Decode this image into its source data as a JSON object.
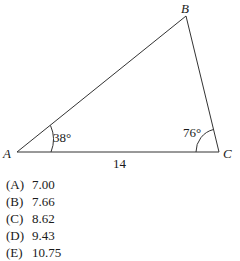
{
  "figure": {
    "vertices": {
      "A": {
        "label": "A",
        "x": 17,
        "y": 152
      },
      "B": {
        "label": "B",
        "x": 186,
        "y": 16
      },
      "C": {
        "label": "C",
        "x": 219,
        "y": 152
      }
    },
    "angle_A": "38°",
    "angle_C": "76°",
    "side_AC": "14"
  },
  "options": [
    {
      "key": "(A)",
      "value": "7.00"
    },
    {
      "key": "(B)",
      "value": "7.66"
    },
    {
      "key": "(C)",
      "value": "8.62"
    },
    {
      "key": "(D)",
      "value": "9.43"
    },
    {
      "key": "(E)",
      "value": "10.75"
    }
  ]
}
